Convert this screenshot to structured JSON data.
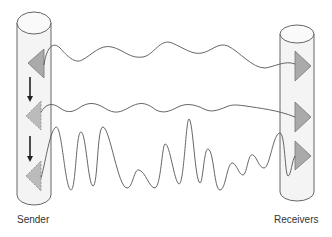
{
  "diagram": {
    "labels": {
      "sender": "Sender",
      "receivers": "Receivers"
    },
    "colors": {
      "cylinder_fill": "#f4f4f4",
      "cylinder_stroke": "#555555",
      "triangle_fill": "#aaaaaa",
      "triangle_stroke": "#777777",
      "wave_stroke": "#555555",
      "arrow": "#222222",
      "label_text": "#333333"
    },
    "sender": {
      "triangles": [
        {
          "style": "solid",
          "direction": "left"
        },
        {
          "style": "dashed",
          "direction": "left"
        },
        {
          "style": "dashed",
          "direction": "left"
        }
      ],
      "arrows": [
        {
          "direction": "down"
        },
        {
          "direction": "down"
        }
      ]
    },
    "receivers": {
      "triangles": [
        {
          "style": "solid",
          "direction": "right"
        },
        {
          "style": "solid",
          "direction": "right"
        },
        {
          "style": "solid",
          "direction": "right"
        }
      ]
    },
    "signals": [
      {
        "name": "signal-1",
        "type": "gentle-wave"
      },
      {
        "name": "signal-2",
        "type": "gentle-wave"
      },
      {
        "name": "signal-3",
        "type": "high-amplitude-wave"
      }
    ]
  }
}
